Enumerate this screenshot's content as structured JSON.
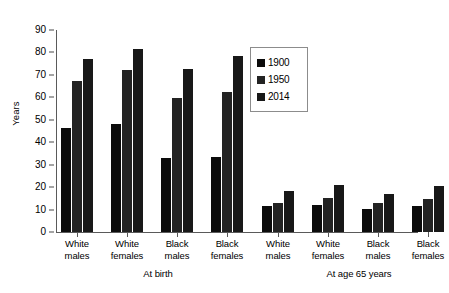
{
  "chart_data": {
    "type": "bar",
    "title": "",
    "xlabel": "",
    "ylabel": "Years",
    "ylim": [
      0,
      90
    ],
    "ytick_step": 10,
    "yticks": [
      "0",
      "10",
      "20",
      "30",
      "40",
      "50",
      "60",
      "70",
      "80",
      "90"
    ],
    "grid": false,
    "legend_position": "upper center",
    "categories": [
      "White males",
      "White females",
      "Black males",
      "Black females",
      "White males",
      "White females",
      "Black males",
      "Black females"
    ],
    "group_labels": [
      "At birth",
      "At age 65 years"
    ],
    "series": [
      {
        "name": "1900",
        "color": "#0b0b0b",
        "values": [
          46.3,
          48.3,
          33.0,
          33.5,
          11.5,
          12.2,
          10.4,
          11.4
        ]
      },
      {
        "name": "1950",
        "color": "#232323",
        "values": [
          67.4,
          72.2,
          59.5,
          62.5,
          12.8,
          15.0,
          12.8,
          14.9
        ]
      },
      {
        "name": "2014",
        "color": "#181818",
        "values": [
          76.9,
          81.6,
          72.8,
          78.6,
          18.4,
          20.9,
          17.1,
          20.3
        ]
      }
    ],
    "groups": [
      {
        "label": "At birth",
        "clusters": [
          {
            "label_line1": "White",
            "label_line2": "males",
            "values": [
              46.3,
              67.4,
              76.9
            ]
          },
          {
            "label_line1": "White",
            "label_line2": "females",
            "values": [
              48.3,
              72.2,
              81.6
            ]
          },
          {
            "label_line1": "Black",
            "label_line2": "males",
            "values": [
              33.0,
              59.5,
              72.8
            ]
          },
          {
            "label_line1": "Black",
            "label_line2": "females",
            "values": [
              33.5,
              62.5,
              78.6
            ]
          }
        ]
      },
      {
        "label": "At age 65 years",
        "clusters": [
          {
            "label_line1": "White",
            "label_line2": "males",
            "values": [
              11.5,
              12.8,
              18.4
            ]
          },
          {
            "label_line1": "White",
            "label_line2": "females",
            "values": [
              12.2,
              15.0,
              20.9
            ]
          },
          {
            "label_line1": "Black",
            "label_line2": "males",
            "values": [
              10.4,
              12.8,
              17.1
            ]
          },
          {
            "label_line1": "Black",
            "label_line2": "females",
            "values": [
              11.4,
              14.9,
              20.3
            ]
          }
        ]
      }
    ],
    "legend": [
      {
        "label": "1900",
        "color": "#0b0b0b"
      },
      {
        "label": "1950",
        "color": "#232323"
      },
      {
        "label": "2014",
        "color": "#181818"
      }
    ]
  }
}
